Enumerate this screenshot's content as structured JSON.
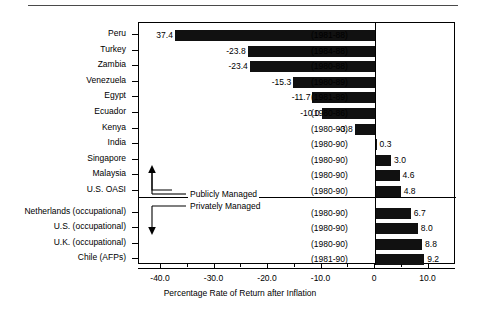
{
  "chart_data": {
    "type": "bar",
    "orientation": "horizontal",
    "title": "",
    "xlabel": "Percentage Rate of Return after Inflation",
    "ylabel": "",
    "xlim": [
      -44.5,
      14.8
    ],
    "xticks": [
      -40.0,
      -30.0,
      -20.0,
      -10.0,
      0,
      10.0
    ],
    "xticklabels": [
      "-40.0",
      "-30.0",
      "-20.0",
      "-10.0",
      "0",
      "10.0"
    ],
    "minor_xticks": [
      -35.0,
      -25.0,
      -15.0,
      -5.0,
      5.0
    ],
    "grid": false,
    "legend": null,
    "categories": [
      "Peru",
      "Turkey",
      "Zambia",
      "Venezuela",
      "Egypt",
      "Ecuador",
      "Kenya",
      "India",
      "Singapore",
      "Malaysia",
      "U.S. OASI",
      "Netherlands (occupational)",
      "U.S. (occupational)",
      "U.K. (occupational)",
      "Chile (AFPs)"
    ],
    "values": [
      -37.4,
      -23.8,
      -23.4,
      -15.3,
      -11.7,
      -10.0,
      -3.8,
      0.3,
      3.0,
      4.6,
      4.8,
      6.7,
      8.0,
      8.8,
      9.2
    ],
    "value_labels": [
      "37.4",
      "-23.8",
      "-23.4",
      "-15.3",
      "-11.7",
      "-10.0",
      "-3.8",
      "0.3",
      "3.0",
      "4.6",
      "4.8",
      "6.7",
      "8.0",
      "8.8",
      "9.2"
    ],
    "period_labels": [
      "(1981-88)",
      "(1984-88)",
      "(1980-88)",
      "(1980-89)",
      "(1981-89)",
      "(1980-86)",
      "(1980-90)",
      "(1980-90)",
      "(1980-90)",
      "(1980-90)",
      "(1980-90)",
      "(1980-90)",
      "(1980-90)",
      "(1980-90)",
      "(1981-90)"
    ],
    "groups": [
      {
        "name": "Publicly Managed",
        "start_index": 0,
        "end_index": 10
      },
      {
        "name": "Privately Managed",
        "start_index": 11,
        "end_index": 14
      }
    ],
    "bar_color": "#111111"
  },
  "annotations": {
    "publicly_managed": "Publicly Managed",
    "privately_managed": "Privately Managed"
  },
  "axis": {
    "x_title": "Percentage Rate of Return after Inflation"
  }
}
